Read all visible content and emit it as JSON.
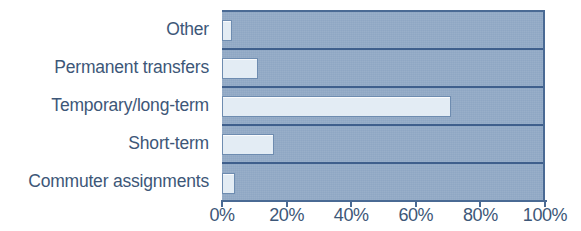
{
  "chart_data": {
    "type": "bar",
    "orientation": "horizontal",
    "title": "",
    "subtitle": "",
    "xlabel": "",
    "ylabel": "",
    "categories": [
      "Other",
      "Permanent transfers",
      "Temporary/long-term",
      "Short-term",
      "Commuter assignments"
    ],
    "values": [
      3,
      11,
      71,
      16,
      4
    ],
    "value_suffix": "%",
    "xlim": [
      0,
      100
    ],
    "tick_values": [
      0,
      20,
      40,
      60,
      80,
      100
    ],
    "tick_labels": [
      "0%",
      "20%",
      "40%",
      "60%",
      "80%",
      "100%"
    ],
    "grid": false,
    "legend": null,
    "legend_position": "none",
    "colors": {
      "plot_background": "#8fa7c4",
      "bar_fill": "#e3ecf4",
      "bar_border": "#6e8cb0",
      "band_divider": "#3f5f8c",
      "axis_line": "#4a6a94",
      "text": "#3d5778",
      "page_background": "#ffffff"
    }
  }
}
